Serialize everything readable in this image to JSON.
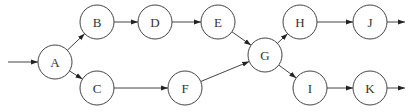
{
  "diagram": {
    "type": "directed-graph",
    "node_radius": 17,
    "colors": {
      "stroke": "#444444",
      "fill": "#ffffff",
      "text": "#333333"
    },
    "nodes": [
      {
        "id": "A",
        "label": "A",
        "x": 55,
        "y": 62
      },
      {
        "id": "B",
        "label": "B",
        "x": 97,
        "y": 22
      },
      {
        "id": "C",
        "label": "C",
        "x": 97,
        "y": 88
      },
      {
        "id": "D",
        "label": "D",
        "x": 155,
        "y": 22
      },
      {
        "id": "E",
        "label": "E",
        "x": 218,
        "y": 22
      },
      {
        "id": "F",
        "label": "F",
        "x": 185,
        "y": 88
      },
      {
        "id": "G",
        "label": "G",
        "x": 265,
        "y": 55
      },
      {
        "id": "H",
        "label": "H",
        "x": 300,
        "y": 22
      },
      {
        "id": "I",
        "label": "I",
        "x": 310,
        "y": 88
      },
      {
        "id": "J",
        "label": "J",
        "x": 370,
        "y": 22
      },
      {
        "id": "K",
        "label": "K",
        "x": 370,
        "y": 88
      }
    ],
    "edges": [
      {
        "from": "start",
        "to": "A"
      },
      {
        "from": "A",
        "to": "B"
      },
      {
        "from": "A",
        "to": "C"
      },
      {
        "from": "B",
        "to": "D"
      },
      {
        "from": "D",
        "to": "E"
      },
      {
        "from": "E",
        "to": "G"
      },
      {
        "from": "C",
        "to": "F"
      },
      {
        "from": "F",
        "to": "G"
      },
      {
        "from": "G",
        "to": "H"
      },
      {
        "from": "G",
        "to": "I"
      },
      {
        "from": "H",
        "to": "J"
      },
      {
        "from": "I",
        "to": "K"
      },
      {
        "from": "J",
        "to": "end"
      },
      {
        "from": "K",
        "to": "end"
      }
    ],
    "entry": {
      "x1": 8,
      "y1": 62
    },
    "exits": [
      {
        "from": "J",
        "x2": 405,
        "y2": 22
      },
      {
        "from": "K",
        "x2": 405,
        "y2": 88
      }
    ]
  }
}
